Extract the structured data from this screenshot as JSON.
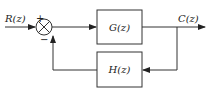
{
  "diagram": {
    "type": "feedback-control-block-diagram",
    "input_label": "R(z)",
    "output_label": "C(z)",
    "summing_junction": {
      "plus_sign": "+",
      "minus_sign": "−"
    },
    "forward_block": {
      "label": "G(z)"
    },
    "feedback_block": {
      "label": "H(z)"
    }
  }
}
